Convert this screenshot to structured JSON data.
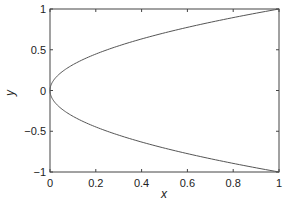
{
  "chart_data": {
    "type": "line",
    "title": "",
    "xlabel": "x",
    "ylabel": "y",
    "xlim": [
      0,
      1
    ],
    "ylim": [
      -1,
      1
    ],
    "xticks": [
      "0",
      "0.2",
      "0.4",
      "0.6",
      "0.8",
      "1"
    ],
    "yticks": [
      "1",
      "0.5",
      "0",
      "-0.5",
      "-1"
    ],
    "grid": false,
    "legend": null,
    "series": [
      {
        "name": "upper",
        "description": "y = sqrt(x)",
        "x": [
          0,
          0.01,
          0.05,
          0.1,
          0.2,
          0.4,
          0.6,
          0.8,
          1
        ],
        "y": [
          0,
          0.1,
          0.224,
          0.316,
          0.447,
          0.632,
          0.775,
          0.894,
          1
        ]
      },
      {
        "name": "lower",
        "description": "y = -sqrt(x)",
        "x": [
          0,
          0.01,
          0.05,
          0.1,
          0.2,
          0.4,
          0.6,
          0.8,
          1
        ],
        "y": [
          0,
          -0.1,
          -0.224,
          -0.316,
          -0.447,
          -0.632,
          -0.775,
          -0.894,
          -1
        ]
      }
    ],
    "line_color": "#555555"
  }
}
